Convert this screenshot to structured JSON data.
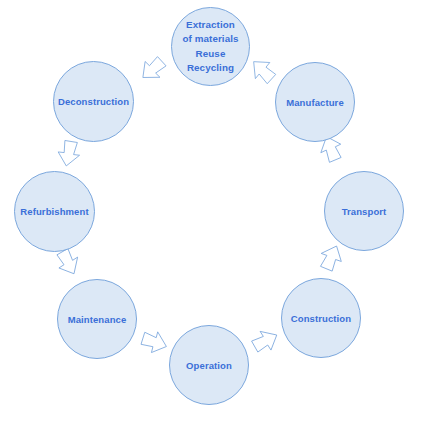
{
  "diagram": {
    "type": "cycle",
    "direction": "clockwise",
    "colors": {
      "node_fill": "#dce8f6",
      "node_border": "#7ba7dd",
      "label_text": "#3a6fd8",
      "arrow_fill": "#ffffff",
      "arrow_border": "#7ba7dd",
      "background": "#ffffff"
    },
    "nodes": [
      {
        "id": "extraction",
        "label": "Extraction\nof materials\nReuse\nRecycling",
        "multiline": true,
        "x": 171,
        "y": 7,
        "size": 79
      },
      {
        "id": "manufacture",
        "label": "Manufacture",
        "multiline": false,
        "x": 275,
        "y": 62,
        "size": 80
      },
      {
        "id": "transport",
        "label": "Transport",
        "multiline": false,
        "x": 324,
        "y": 171,
        "size": 80
      },
      {
        "id": "construction",
        "label": "Construction",
        "multiline": false,
        "x": 281,
        "y": 278,
        "size": 80
      },
      {
        "id": "operation",
        "label": "Operation",
        "multiline": false,
        "x": 169,
        "y": 325,
        "size": 80
      },
      {
        "id": "maintenance",
        "label": "Maintenance",
        "multiline": false,
        "x": 57,
        "y": 279,
        "size": 80
      },
      {
        "id": "refurbishment",
        "label": "Refurbishment",
        "multiline": false,
        "x": 14,
        "y": 171,
        "size": 81
      },
      {
        "id": "deconstruction",
        "label": "Deconstruction",
        "multiline": false,
        "x": 53,
        "y": 61,
        "size": 81
      }
    ],
    "arrows": [
      {
        "id": "extraction-to-manufacture",
        "from": "extraction",
        "to": "manufacture",
        "x": 248,
        "y": 56,
        "rotation": 135
      },
      {
        "id": "manufacture-to-transport",
        "from": "manufacture",
        "to": "transport",
        "x": 316,
        "y": 134,
        "rotation": 160
      },
      {
        "id": "transport-to-construction",
        "from": "transport",
        "to": "construction",
        "x": 316,
        "y": 243,
        "rotation": 205
      },
      {
        "id": "construction-to-operation",
        "from": "construction",
        "to": "operation",
        "x": 250,
        "y": 326,
        "rotation": 243
      },
      {
        "id": "operation-to-maintenance",
        "from": "operation",
        "to": "maintenance",
        "x": 139,
        "y": 327,
        "rotation": 290
      },
      {
        "id": "maintenance-to-refurbishment",
        "from": "maintenance",
        "to": "refurbishment",
        "x": 53,
        "y": 247,
        "rotation": 333
      },
      {
        "id": "refurbishment-to-deconstruction",
        "from": "refurbishment",
        "to": "deconstruction",
        "x": 54,
        "y": 138,
        "rotation": 12
      },
      {
        "id": "deconstruction-to-extraction",
        "from": "deconstruction",
        "to": "extraction",
        "x": 138,
        "y": 54,
        "rotation": 50
      }
    ]
  }
}
